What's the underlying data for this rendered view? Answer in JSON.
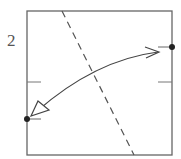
{
  "diagram": {
    "type": "origami-fold-step",
    "step_number": "2",
    "paper": {
      "shape": "square",
      "x": 27,
      "y": 11,
      "size": 145,
      "stroke": "#666666"
    },
    "fold_line": {
      "style": "dashed",
      "from": [
        62,
        11
      ],
      "to": [
        134,
        155
      ],
      "color": "#666666"
    },
    "midpoint_marks": [
      {
        "side": "left",
        "y": 82
      },
      {
        "side": "right",
        "y": 82
      }
    ],
    "reference_points": [
      {
        "name": "right-edge-point",
        "x": 172,
        "y": 47
      },
      {
        "name": "left-edge-point",
        "x": 27,
        "y": 119
      }
    ],
    "action_arrow": {
      "kind": "fold-and-unfold",
      "from": [
        160,
        52
      ],
      "to": [
        31,
        115
      ],
      "color": "#444444"
    }
  }
}
